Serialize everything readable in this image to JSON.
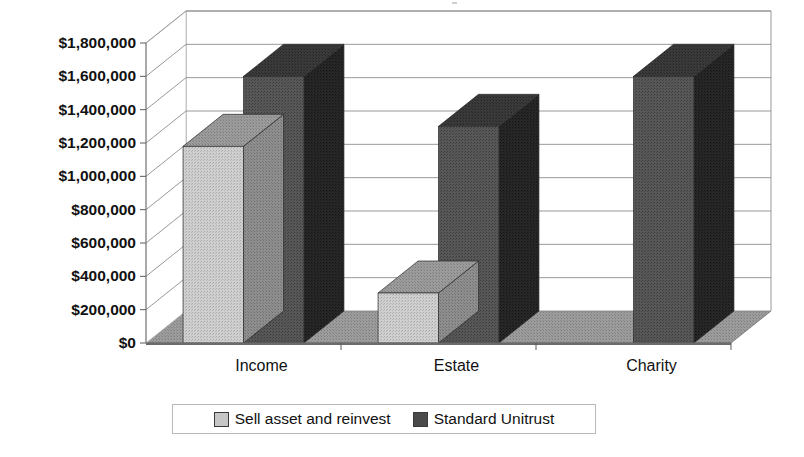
{
  "chart_data": {
    "type": "bar",
    "title": "",
    "subtitle": "",
    "xlabel": "",
    "ylabel": "",
    "categories": [
      "Income",
      "Estate",
      "Charity"
    ],
    "series": [
      {
        "name": "Sell asset and reinvest",
        "values": [
          1180000,
          300000,
          0
        ],
        "color": "#c6c6c6"
      },
      {
        "name": "Standard Unitrust",
        "values": [
          1600000,
          1300000,
          1600000
        ],
        "color": "#4a4a4a"
      }
    ],
    "ylim": [
      0,
      1800000
    ],
    "ytick_values": [
      0,
      200000,
      400000,
      600000,
      800000,
      1000000,
      1200000,
      1400000,
      1600000,
      1800000
    ],
    "ytick_labels": [
      "$0",
      "$200,000",
      "$400,000",
      "$600,000",
      "$800,000",
      "$1,000,000",
      "$1,200,000",
      "$1,400,000",
      "$1,600,000",
      "$1,800,000"
    ],
    "grid": true,
    "three_d": true,
    "legend_position": "bottom",
    "legend_entries": [
      "Sell asset and reinvest",
      "Standard Unitrust"
    ],
    "palette": {
      "series_light": "#c6c6c6",
      "series_dark": "#4a4a4a",
      "floor": "#8a8a8a",
      "gridline": "#8d8d8d",
      "text": "#111111"
    }
  },
  "legend": {
    "items": [
      {
        "label": "Sell asset and reinvest",
        "swatch": "#c6c6c6",
        "icon": "legend-swatch-icon"
      },
      {
        "label": "Standard Unitrust",
        "swatch": "#4a4a4a",
        "icon": "legend-swatch-icon"
      }
    ]
  }
}
